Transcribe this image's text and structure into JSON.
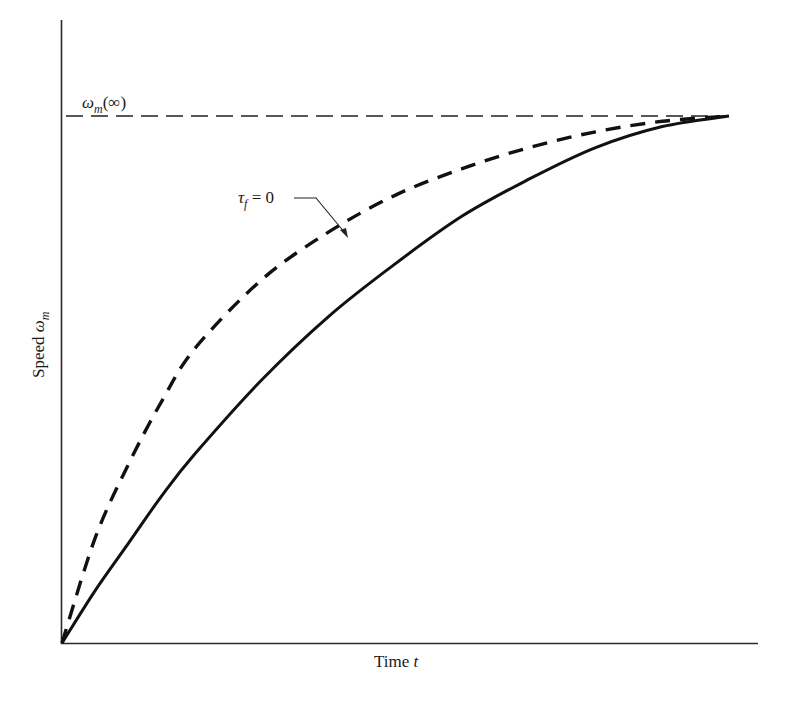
{
  "chart_data": {
    "type": "line",
    "title": "",
    "xlabel": "Time t",
    "ylabel": "Speed ω_m",
    "xlabel_parts": {
      "text": "Time ",
      "var": "t"
    },
    "ylabel_parts": {
      "text": "Speed ",
      "var": "ω",
      "sub": "m"
    },
    "grid": false,
    "legend": null,
    "axis_ticks": "none",
    "xlim": [
      0,
      1
    ],
    "ylim": [
      0,
      1.13
    ],
    "x": [
      0,
      0.05,
      0.1,
      0.15,
      0.2,
      0.3,
      0.4,
      0.5,
      0.6,
      0.7,
      0.8,
      0.9,
      1.0
    ],
    "series": [
      {
        "name": "τ_f = 0",
        "style": "dashed",
        "values": [
          0,
          0.2,
          0.34,
          0.46,
          0.56,
          0.69,
          0.78,
          0.85,
          0.9,
          0.94,
          0.97,
          0.99,
          1.0
        ]
      },
      {
        "name": "τ_f > 0",
        "style": "solid",
        "values": [
          0,
          0.1,
          0.19,
          0.28,
          0.36,
          0.5,
          0.62,
          0.72,
          0.81,
          0.88,
          0.94,
          0.98,
          1.0
        ]
      }
    ],
    "reference_lines": [
      {
        "type": "horizontal",
        "y": 1.0,
        "style": "dashed",
        "label": "ω_m(∞)"
      }
    ],
    "annotations": [
      {
        "text": "τ_f = 0",
        "points_to": "dashed curve"
      },
      {
        "text": "ω_m(∞)",
        "position": "above asymptote, left"
      }
    ]
  },
  "labels": {
    "asymptote": {
      "sym": "ω",
      "sub": "m",
      "rest": "(∞)"
    },
    "tau": {
      "sym": "τ",
      "sub": "f",
      "rest": " = 0"
    },
    "xaxis": {
      "text": "Time ",
      "var": "t"
    },
    "yaxis": {
      "text": "Speed ",
      "sym": "ω",
      "sub": "m"
    }
  },
  "colors": {
    "line": "#111111",
    "axis": "#2a2a2a",
    "background": "#ffffff"
  }
}
